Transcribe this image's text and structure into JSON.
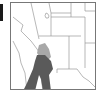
{
  "figure": {
    "type": "map",
    "region": "southwestern-united-states",
    "colors": {
      "background": "#ffffff",
      "border": "#777777",
      "state_lines": "#9a9a9a",
      "shade_light": "#a8a8a8",
      "shade_dark": "#5a5a5a",
      "side_bar": "#1a1a1a"
    },
    "legend": []
  }
}
